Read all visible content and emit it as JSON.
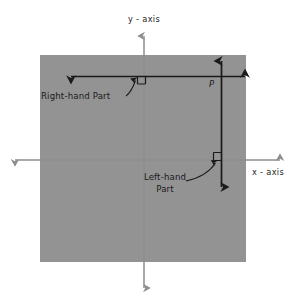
{
  "figure": {
    "background_color": "#ffffff",
    "plane_fill_color": "#939393",
    "axis_color": "#8e8e8e",
    "line_color": "#1a1a1a",
    "text_color": "#1a1a1a"
  },
  "axes": {
    "y_axis_label": "y - axis",
    "x_axis_label": "x - axis"
  },
  "point": {
    "label": "P"
  },
  "annotations": {
    "right_hand": {
      "label": "Right-hand Part"
    },
    "left_hand": {
      "line1": "Left-hand",
      "line2": "Part"
    }
  },
  "markers": {
    "right_angle_upper": "right-angle",
    "right_angle_lower": "right-angle"
  }
}
